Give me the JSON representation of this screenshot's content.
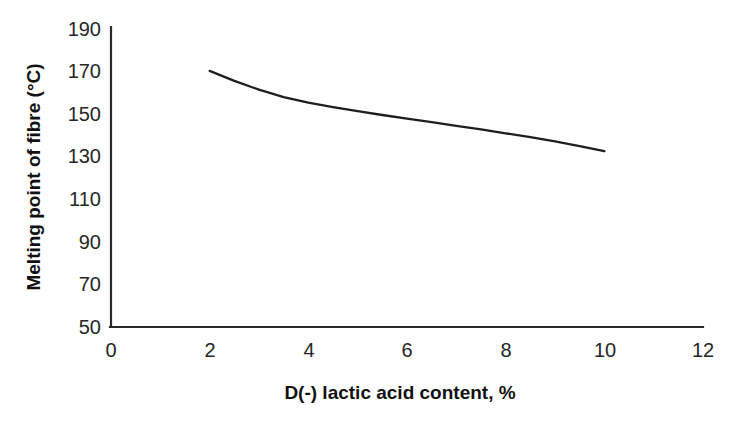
{
  "chart_data": {
    "type": "line",
    "title": "",
    "subtitle": "",
    "xlabel": "D(-) lactic acid content, %",
    "ylabel": "Melting point of fibre (°C)",
    "xlim": [
      0,
      12
    ],
    "ylim": [
      50,
      190
    ],
    "xticks": [
      0,
      2,
      4,
      6,
      8,
      10,
      12
    ],
    "yticks": [
      50,
      70,
      90,
      110,
      130,
      150,
      170,
      190
    ],
    "xtick_labels": [
      "0",
      "2",
      "4",
      "6",
      "8",
      "10",
      "12"
    ],
    "ytick_labels": [
      "50",
      "70",
      "90",
      "110",
      "130",
      "150",
      "170",
      "190"
    ],
    "grid": false,
    "legend": false,
    "legend_position": "none",
    "series": [
      {
        "name": "Melting point of fibre",
        "color": "#1e1e1e",
        "markers": false,
        "x": [
          2.0,
          2.5,
          3.0,
          3.5,
          4.0,
          4.5,
          5.0,
          5.5,
          6.0,
          6.5,
          7.0,
          7.5,
          8.0,
          8.5,
          9.0,
          9.5,
          10.0
        ],
        "y": [
          170.3,
          165.6,
          161.5,
          158.0,
          155.4,
          153.3,
          151.4,
          149.6,
          147.9,
          146.2,
          144.5,
          142.8,
          141.0,
          139.2,
          137.2,
          135.0,
          132.6
        ]
      }
    ],
    "annotations": []
  },
  "axes": {
    "x_axis_name": "x-axis",
    "y_axis_name": "y-axis"
  }
}
